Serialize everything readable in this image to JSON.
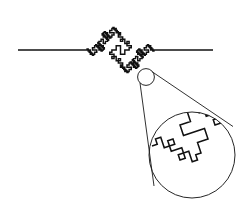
{
  "figure": {
    "type": "diagram",
    "width": 248,
    "height": 202,
    "background_color": "#ffffff",
    "ink_color": "#111111"
  },
  "baseline": {
    "label": "horizontal base line",
    "y": 50,
    "left_segment": {
      "x1": 18,
      "x2": 86
    },
    "right_segment": {
      "x1": 155,
      "x2": 213
    }
  },
  "main_curve": {
    "name": "quadratic-koch-curve",
    "description": "staircase fractal bump rising above the baseline then descending below it",
    "iterations": 3,
    "generator": [
      {
        "dx": 0,
        "dy": 0
      },
      {
        "dx": 0.25,
        "dy": 0
      },
      {
        "dx": 0.25,
        "dy": -0.25
      },
      {
        "dx": 0.5,
        "dy": -0.25
      },
      {
        "dx": 0.5,
        "dy": 0.25
      },
      {
        "dx": 0.75,
        "dy": 0.25
      },
      {
        "dx": 0.75,
        "dy": 0
      },
      {
        "dx": 1,
        "dy": 0
      }
    ],
    "start": {
      "x": 86,
      "y": 50
    },
    "end": {
      "x": 155,
      "y": 50
    },
    "amplitude": 1.0,
    "peak_top_y": 13,
    "lowest_y": 78,
    "stroke_width": 1.45
  },
  "small_circle": {
    "label": "region-of-interest marker",
    "cx": 146,
    "cy": 77,
    "r": 8.4,
    "stroke_width": 0.95
  },
  "large_circle": {
    "label": "magnified detail view",
    "cx": 192,
    "cy": 155,
    "r": 43,
    "stroke_width": 0.95,
    "magnification": "5x"
  },
  "leader_lines": [
    {
      "name": "leader-upper",
      "x1": 152.5,
      "y1": 72.0,
      "x2": 233.0,
      "y2": 126.5
    },
    {
      "name": "leader-lower",
      "x1": 140.0,
      "y1": 83.0,
      "x2": 154.0,
      "y2": 186.0
    }
  ],
  "detail_curve": {
    "name": "magnified-fractal-segment",
    "description": "the same generator motif redrawn at larger scale inside the detail circle",
    "iterations": 2,
    "start": {
      "x": 152,
      "y": 146
    },
    "end": {
      "x": 236,
      "y": 118
    },
    "stroke_width": 1.55
  },
  "legend": {
    "visible": false,
    "entries": []
  }
}
